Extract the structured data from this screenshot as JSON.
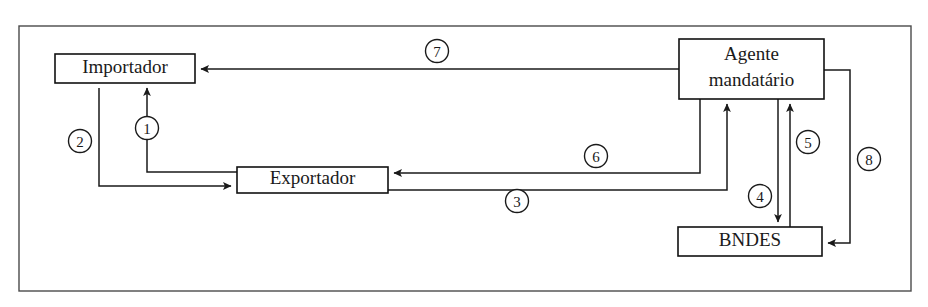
{
  "diagram": {
    "background_color": "#ffffff",
    "line_color": "#1a1a1a",
    "frame_color": "#4a4a4a",
    "frame": {
      "x": 19,
      "y": 26,
      "width": 892,
      "height": 265
    },
    "nodes": [
      {
        "id": "importador",
        "label": "Importador",
        "lines": [
          "Importador"
        ],
        "x": 55,
        "y": 54,
        "width": 140,
        "height": 29
      },
      {
        "id": "exportador",
        "label": "Exportador",
        "lines": [
          "Exportador"
        ],
        "x": 237,
        "y": 167,
        "width": 151,
        "height": 26
      },
      {
        "id": "agente-mandatario",
        "label": "Agente mandatário",
        "lines": [
          "Agente",
          "mandatário"
        ],
        "x": 679,
        "y": 39,
        "width": 145,
        "height": 60
      },
      {
        "id": "bndes",
        "label": "BNDES",
        "lines": [
          "BNDES"
        ],
        "x": 678,
        "y": 227,
        "width": 144,
        "height": 29
      }
    ],
    "connections": [
      {
        "step": "1",
        "from": "exportador",
        "to": "importador",
        "label_x": 147,
        "label_y": 128,
        "path": "M 237 172 L 147 172 L 147 88",
        "arrow": "up",
        "arrow_x": 147,
        "arrow_y": 84
      },
      {
        "step": "2",
        "from": "importador",
        "to": "exportador",
        "label_x": 80,
        "label_y": 141,
        "path": "M 99 88 L 99 186 L 231 186",
        "arrow": "right-and-up",
        "arrow_x": 236,
        "arrow_y": 186
      },
      {
        "step": "3",
        "from": "exportador",
        "to": "agente-mandatario",
        "label_x": 517,
        "label_y": 201,
        "path": "M 388 190 L 727 190 L 727 104",
        "arrow": "up",
        "arrow_x": 727,
        "arrow_y": 100
      },
      {
        "step": "4",
        "from": "agente-mandatario",
        "to": "bndes",
        "label_x": 760,
        "label_y": 196,
        "path": "M 778 99 L 778 222",
        "arrow": "down",
        "arrow_x": 778,
        "arrow_y": 226
      },
      {
        "step": "5",
        "from": "bndes",
        "to": "agente-mandatario",
        "label_x": 808,
        "label_y": 142,
        "path": "M 790 227 L 790 104",
        "arrow": "up",
        "arrow_x": 790,
        "arrow_y": 100
      },
      {
        "step": "6",
        "from": "agente-mandatario",
        "to": "exportador",
        "label_x": 596,
        "label_y": 156,
        "path": "M 700 99 L 700 173 L 394 173",
        "arrow": "left",
        "arrow_x": 389,
        "arrow_y": 173
      },
      {
        "step": "7",
        "from": "agente-mandatario",
        "to": "importador",
        "label_x": 437,
        "label_y": 51,
        "path": "M 679 69 L 201 69",
        "arrow": "left",
        "arrow_x": 196,
        "arrow_y": 69
      },
      {
        "step": "8",
        "from": "agente-mandatario",
        "to": "bndes",
        "label_x": 869,
        "label_y": 159,
        "path": "M 824 70 L 850 70 L 850 243 L 828 243",
        "arrow": "left",
        "arrow_x": 823,
        "arrow_y": 243
      }
    ]
  }
}
